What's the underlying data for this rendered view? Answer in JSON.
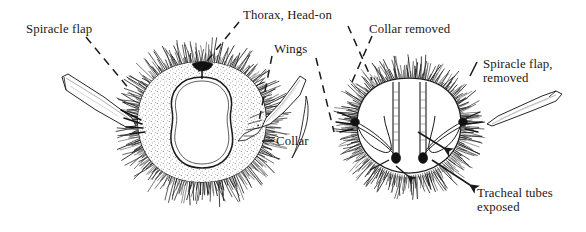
{
  "figure": {
    "kind": "scientific-line-illustration",
    "subject": "Thorax, Head-on",
    "background_color": "#ffffff",
    "ink_color": "#1a1a1a",
    "width": 586,
    "height": 232
  },
  "labels": [
    {
      "id": "spiracle-flap",
      "text": "Spiracle flap",
      "x": 26,
      "y": 22,
      "leader": "dashed"
    },
    {
      "id": "thorax-head-on",
      "text": "Thorax, Head-on",
      "x": 243,
      "y": 8,
      "leader": "dashed"
    },
    {
      "id": "wings",
      "text": "Wings",
      "x": 274,
      "y": 42,
      "leader": "dashed"
    },
    {
      "id": "collar",
      "text": "Collar",
      "x": 276,
      "y": 134,
      "leader": "solid-dash"
    },
    {
      "id": "collar-removed",
      "text": "Collar removed",
      "x": 369,
      "y": 22,
      "leader": "dashed"
    },
    {
      "id": "spiracle-flap-removed-line1",
      "text": "Spiracle flap,",
      "x": 483,
      "y": 57,
      "leader": "solid-tick"
    },
    {
      "id": "spiracle-flap-removed-line2",
      "text": "removed",
      "x": 483,
      "y": 71,
      "leader": "none"
    },
    {
      "id": "tracheal-tubes-line1",
      "text": "Tracheal tubes",
      "x": 477,
      "y": 186,
      "leader": "arrow"
    },
    {
      "id": "tracheal-tubes-line2",
      "text": "exposed",
      "x": 477,
      "y": 200,
      "leader": "none"
    }
  ],
  "specimens": [
    {
      "id": "left-specimen",
      "name": "thorax-intact",
      "caption": "Thorax, Head-on",
      "center_x": 202,
      "center_y": 122,
      "features": [
        "spiracle-flap-left",
        "wing-right",
        "collar-ring",
        "radiating-hairs",
        "dorsal-notch"
      ]
    },
    {
      "id": "right-specimen",
      "name": "thorax-dissected",
      "caption": "Collar removed",
      "center_x": 409,
      "center_y": 126,
      "features": [
        "tracheal-tube-left",
        "tracheal-tube-right",
        "spiracle-opening-left",
        "spiracle-opening-right",
        "radiating-hairs",
        "spiracle-flap-detached"
      ]
    }
  ]
}
